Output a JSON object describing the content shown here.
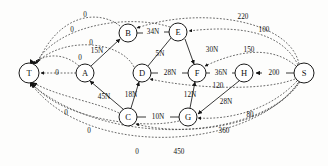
{
  "diagram": {
    "type": "directed-graph",
    "colors": {
      "node_stroke": "#1a1a1a",
      "node_fill": "#ffffff",
      "solid_edge": "#222222",
      "dashed_edge": "#3a3a3a",
      "background": "#fdfdfc"
    },
    "nodes": [
      {
        "id": "T",
        "label": "T",
        "x": 29,
        "y": 73,
        "r": 10
      },
      {
        "id": "A",
        "label": "A",
        "x": 85,
        "y": 73,
        "r": 9
      },
      {
        "id": "B",
        "label": "B",
        "x": 128,
        "y": 33,
        "r": 9
      },
      {
        "id": "E",
        "label": "E",
        "x": 178,
        "y": 32,
        "r": 9
      },
      {
        "id": "D",
        "label": "D",
        "x": 142,
        "y": 73,
        "r": 9
      },
      {
        "id": "F",
        "label": "F",
        "x": 197,
        "y": 73,
        "r": 9
      },
      {
        "id": "H",
        "label": "H",
        "x": 244,
        "y": 73,
        "r": 9
      },
      {
        "id": "S",
        "label": "S",
        "x": 304,
        "y": 73,
        "r": 10
      },
      {
        "id": "C",
        "label": "C",
        "x": 128,
        "y": 117,
        "r": 9
      },
      {
        "id": "G",
        "label": "G",
        "x": 188,
        "y": 117,
        "r": 9
      }
    ],
    "solid_edges": [
      {
        "from": "B",
        "to": "E",
        "value": "34",
        "unit": "N",
        "label": "34N",
        "lx": 153,
        "ly": 32
      },
      {
        "from": "D",
        "to": "F",
        "value": "28",
        "unit": "N",
        "label": "28N",
        "lx": 170,
        "ly": 73
      },
      {
        "from": "F",
        "to": "H",
        "value": "36",
        "unit": "N",
        "label": "36N",
        "lx": 221,
        "ly": 73
      },
      {
        "from": "C",
        "to": "G",
        "value": "10",
        "unit": "N",
        "label": "10N",
        "lx": 158,
        "ly": 117
      },
      {
        "from": "A",
        "to": "B",
        "value": "15",
        "unit": "N",
        "label": "15N",
        "lx": 97,
        "ly": 51
      },
      {
        "from": "D",
        "to": "E",
        "value": "5",
        "unit": "N",
        "label": "5N",
        "lx": 160,
        "ly": 54
      },
      {
        "from": "E",
        "to": "F",
        "value": "30",
        "unit": "N",
        "label": "30N",
        "lx": 212,
        "ly": 50
      },
      {
        "from": "C",
        "to": "A",
        "value": "45",
        "unit": "N",
        "label": "45N",
        "lx": 104,
        "ly": 97
      },
      {
        "from": "C",
        "to": "D",
        "value": "18",
        "unit": "N",
        "label": "18N",
        "lx": 131,
        "ly": 95
      },
      {
        "from": "G",
        "to": "F",
        "value": "12",
        "unit": "N",
        "label": "12N",
        "lx": 190,
        "ly": 95
      },
      {
        "from": "H",
        "to": "G",
        "value": "28",
        "unit": "N",
        "label": "28N",
        "lx": 226,
        "ly": 102
      },
      {
        "from": "S",
        "to": "H",
        "value": "200",
        "unit": "",
        "label": "200",
        "lx": 274,
        "ly": 73
      }
    ],
    "dashed_edges": [
      {
        "from": "B",
        "to": "T",
        "label": "0",
        "lx": 85,
        "ly": 15
      },
      {
        "from": "E",
        "to": "T",
        "label": "0",
        "lx": 72,
        "ly": 30
      },
      {
        "from": "D",
        "to": "T",
        "label": "0",
        "lx": 91,
        "ly": 43
      },
      {
        "from": "A",
        "to": "T",
        "label": "0",
        "lx": 80,
        "ly": 58
      },
      {
        "from": "A",
        "to": "T",
        "label": "0",
        "lx": 57,
        "ly": 73
      },
      {
        "from": "C",
        "to": "T",
        "label": "0",
        "lx": 66,
        "ly": 113
      },
      {
        "from": "G",
        "to": "T",
        "label": "0",
        "lx": 89,
        "ly": 131
      },
      {
        "from": "S",
        "to": "T",
        "label": "0",
        "lx": 137,
        "ly": 152
      },
      {
        "from": "S",
        "to": "B",
        "label": "220",
        "lx": 243,
        "ly": 17
      },
      {
        "from": "S",
        "to": "E",
        "label": "100",
        "lx": 264,
        "ly": 30
      },
      {
        "from": "S",
        "to": "F",
        "label": "150",
        "lx": 249,
        "ly": 50
      },
      {
        "from": "S",
        "to": "D",
        "label": "120",
        "lx": 218,
        "ly": 86
      },
      {
        "from": "S",
        "to": "G",
        "label": "80",
        "lx": 250,
        "ly": 115
      },
      {
        "from": "S",
        "to": "C",
        "label": "360",
        "lx": 224,
        "ly": 131
      },
      {
        "from": "S",
        "to": "T",
        "label": "450",
        "lx": 179,
        "ly": 152
      }
    ]
  }
}
